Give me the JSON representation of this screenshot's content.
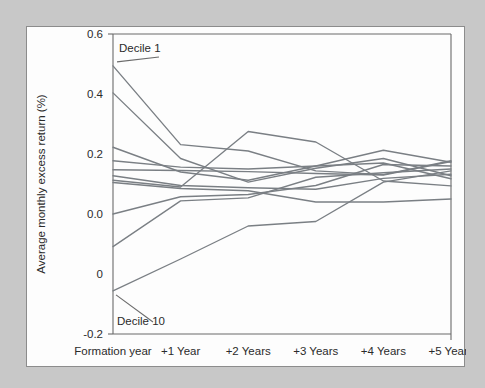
{
  "figure": {
    "background_color": "#c8c8c8",
    "card_color": "#fdfdfd",
    "line_color": "#7a7f84",
    "axis_color": "#6b6b6b"
  },
  "annotations": {
    "top_label": "Decile 1",
    "bottom_label": "Decile 10"
  },
  "chart_data": {
    "type": "line",
    "title": "",
    "xlabel": "",
    "ylabel": "Average monthly excess return (%)",
    "categories": [
      "Formation year",
      "+1 Year",
      "+2 Years",
      "+3 Years",
      "+4 Years",
      "+5 Years"
    ],
    "x_tick_labels": [
      "Formation year",
      "+1 Year",
      "+2 Years",
      "+3 Years",
      "+4 Years",
      "+5 Years"
    ],
    "y_tick_labels": [
      "0.6",
      "0.4",
      "0.2",
      "0.0",
      "0",
      "-0.2"
    ],
    "y_tick_values": [
      0.6,
      0.4,
      0.2,
      0.0,
      -0.1,
      -0.2
    ],
    "ylim": [
      -0.2,
      0.6
    ],
    "xlim": [
      0,
      5
    ],
    "grid": false,
    "legend": "none",
    "series": [
      {
        "name": "Decile 1",
        "values": [
          0.515,
          0.305,
          0.288,
          0.235,
          0.225,
          0.262
        ]
      },
      {
        "name": "Decile 2",
        "values": [
          0.443,
          0.268,
          0.205,
          0.242,
          0.268,
          0.222
        ]
      },
      {
        "name": "Decile 3",
        "values": [
          0.298,
          0.232,
          0.21,
          0.248,
          0.29,
          0.258
        ]
      },
      {
        "name": "Decile 4",
        "values": [
          0.262,
          0.245,
          0.24,
          0.248,
          0.256,
          0.214
        ]
      },
      {
        "name": "Decile 5",
        "values": [
          0.238,
          0.236,
          0.233,
          0.228,
          0.224,
          0.26
        ]
      },
      {
        "name": "Decile 6",
        "values": [
          0.222,
          0.196,
          0.19,
          0.186,
          0.215,
          0.226
        ]
      },
      {
        "name": "Decile 7",
        "values": [
          0.21,
          0.192,
          0.34,
          0.312,
          0.208,
          0.195
        ]
      },
      {
        "name": "Decile 8",
        "values": [
          0.204,
          0.188,
          0.182,
          0.152,
          0.152,
          0.16
        ]
      },
      {
        "name": "Decile 9",
        "values": [
          0.12,
          0.166,
          0.172,
          0.196,
          0.252,
          0.248
        ]
      },
      {
        "name": "Decile 10",
        "values": [
          0.033,
          0.155,
          0.163,
          0.218,
          0.23,
          0.24
        ]
      },
      {
        "name": "Decile 10 low",
        "values": [
          -0.085,
          0.0,
          0.088,
          0.1,
          0.205,
          0.235
        ]
      }
    ]
  }
}
